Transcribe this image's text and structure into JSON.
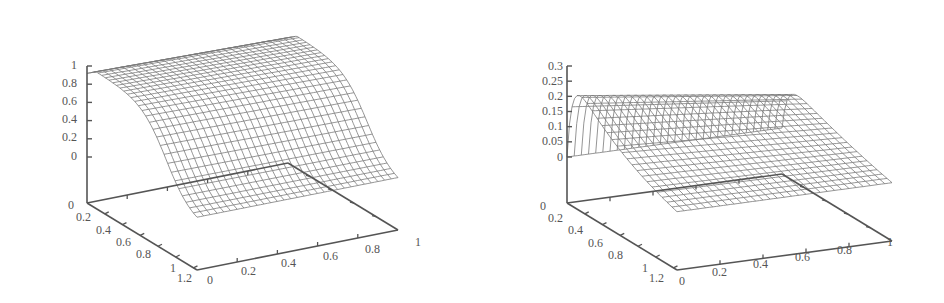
{
  "chart_data": [
    {
      "type": "surface",
      "title": "",
      "subtitle": "",
      "xlabel": "",
      "ylabel": "",
      "zlabel": "",
      "x_ticks": [
        "0",
        "0.2",
        "0.4",
        "0.6",
        "0.8",
        "1"
      ],
      "y_ticks": [
        "0",
        "0.2",
        "0.4",
        "0.6",
        "0.8",
        "1",
        "1.2"
      ],
      "z_ticks": [
        "0",
        "0.2",
        "0.4",
        "0.6",
        "0.8",
        "1"
      ],
      "xlim": [
        0,
        1
      ],
      "ylim": [
        0,
        1.2
      ],
      "zlim": [
        0,
        1
      ],
      "grid": false,
      "legend": null,
      "description": "Wireframe surface: near 0 at y=1.2 (front), rises steeply to ~1 by y~0.2 and stays ~0.95-1 plateau across x in [0,1]; slight slope along x.",
      "sample_profile_along_y": {
        "y": [
          0,
          0.2,
          0.4,
          0.6,
          0.8,
          1.0,
          1.2
        ],
        "z_at_x0": [
          0.95,
          1.0,
          0.97,
          0.85,
          0.6,
          0.3,
          0.0
        ]
      }
    },
    {
      "type": "surface",
      "title": "",
      "subtitle": "",
      "xlabel": "",
      "ylabel": "",
      "zlabel": "",
      "x_ticks": [
        "0",
        "0.2",
        "0.4",
        "0.6",
        "0.8",
        "1"
      ],
      "y_ticks": [
        "0",
        "0.2",
        "0.4",
        "0.6",
        "0.8",
        "1",
        "1.2"
      ],
      "z_ticks": [
        "0",
        "0.05",
        "0.1",
        "0.15",
        "0.2",
        "0.25",
        "0.3"
      ],
      "xlim": [
        0,
        1
      ],
      "ylim": [
        0,
        1.2
      ],
      "zlim": [
        0,
        0.3
      ],
      "grid": false,
      "legend": null,
      "description": "Wireframe surface: peak ~0.28 near y~0.1 at back edge, sharp drop near y=0, decays toward ~0 (slightly negative) as y increases to 1.2; decreases along x toward x=1.",
      "sample_profile_along_y": {
        "y": [
          0,
          0.2,
          0.4,
          0.6,
          0.8,
          1.0,
          1.2
        ],
        "z_at_x0": [
          0.0,
          0.28,
          0.26,
          0.2,
          0.12,
          0.05,
          0.0
        ]
      }
    }
  ],
  "plots": [
    {
      "z_labels": [
        "1",
        "0.8",
        "0.6",
        "0.4",
        "0.2",
        "0"
      ],
      "y_labels": [
        "0",
        "0.2",
        "0.4",
        "0.6",
        "0.8",
        "1",
        "1.2"
      ],
      "x_labels": [
        "0",
        "0.2",
        "0.4",
        "0.6",
        "0.8",
        "1"
      ]
    },
    {
      "z_labels": [
        "0.3",
        "0.25",
        "0.2",
        "0.15",
        "0.1",
        "0.05",
        "0"
      ],
      "y_labels": [
        "0",
        "0.2",
        "0.4",
        "0.6",
        "0.8",
        "1",
        "1.2"
      ],
      "x_labels": [
        "0",
        "0.2",
        "0.4",
        "0.6",
        "0.8",
        "1"
      ]
    }
  ],
  "colors": {
    "axis": "#555555",
    "mesh": "#7a7a7a",
    "background": "#ffffff"
  }
}
